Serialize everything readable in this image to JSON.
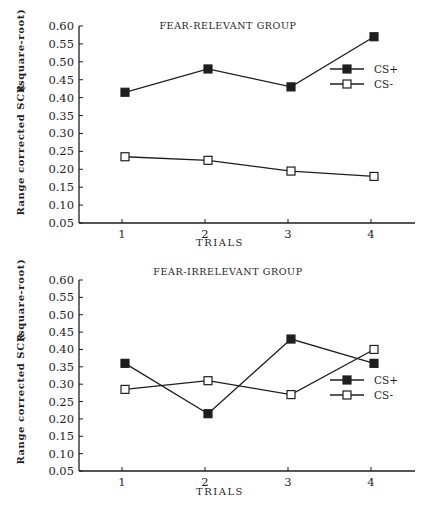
{
  "chart_data": [
    {
      "type": "line",
      "title": "FEAR-RELEVANT  GROUP",
      "xlabel": "TRIALS",
      "ylabel": "Range  corrected  SCR      (square-root)",
      "ylabel_main": "Range  corrected  SCR",
      "ylabel_sub": "(square-root)",
      "x": [
        1,
        2,
        3,
        4
      ],
      "ylim": [
        0.05,
        0.6
      ],
      "yticks": [
        "0.60",
        "0.55",
        "0.50",
        "0.45",
        "0.40",
        "0.35",
        "0.30",
        "0.25",
        "0.20",
        "0.15",
        "0.10",
        "0.05"
      ],
      "xticks": [
        "1",
        "2",
        "3",
        "4"
      ],
      "grid": false,
      "legend_position": "right-middle",
      "series": [
        {
          "name": "CS+",
          "marker": "filled-square",
          "values": [
            0.415,
            0.48,
            0.43,
            0.57
          ]
        },
        {
          "name": "CS-",
          "marker": "open-square",
          "values": [
            0.235,
            0.225,
            0.195,
            0.18
          ]
        }
      ]
    },
    {
      "type": "line",
      "title": "FEAR-IRRELEVANT  GROUP",
      "xlabel": "TRIALS",
      "ylabel": "Range  corrected  SCR      (square-root)",
      "ylabel_main": "Range  corrected  SCR",
      "ylabel_sub": "(square-root)",
      "x": [
        1,
        2,
        3,
        4
      ],
      "ylim": [
        0.05,
        0.6
      ],
      "yticks": [
        "0.60",
        "0.55",
        "0.50",
        "0.45",
        "0.40",
        "0.35",
        "0.30",
        "0.25",
        "0.20",
        "0.15",
        "0.10",
        "0.05"
      ],
      "xticks": [
        "1",
        "2",
        "3",
        "4"
      ],
      "grid": false,
      "legend_position": "right-lower",
      "series": [
        {
          "name": "CS+",
          "marker": "filled-square",
          "values": [
            0.36,
            0.215,
            0.43,
            0.36
          ]
        },
        {
          "name": "CS-",
          "marker": "open-square",
          "values": [
            0.285,
            0.31,
            0.27,
            0.4
          ]
        }
      ]
    }
  ],
  "colors": {
    "ink": "#1e1e1e",
    "background": "#ffffff"
  }
}
